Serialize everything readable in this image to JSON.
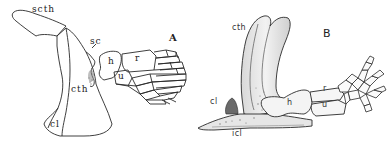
{
  "figure": {
    "panels": [
      {
        "id": "A",
        "letter": "A",
        "labels": {
          "scth": "scth",
          "sc": "sc",
          "cth": "cth",
          "cl": "cl",
          "h": "h",
          "r": "r",
          "u": "u"
        }
      },
      {
        "id": "B",
        "letter": "B",
        "labels": {
          "cth": "cth",
          "cl": "cl",
          "icl": "icl",
          "h": "h",
          "r": "r",
          "u": "u"
        }
      }
    ],
    "colors": {
      "line": "#2a2a2a",
      "shade": "#9a9a9a",
      "background": "#ffffff"
    }
  }
}
